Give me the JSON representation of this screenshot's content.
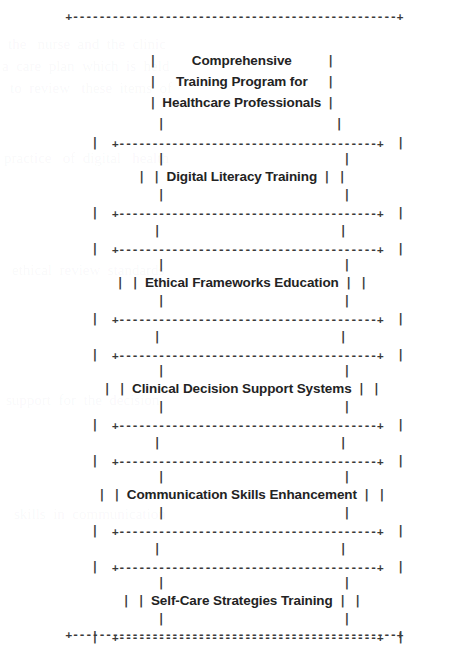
{
  "document": {
    "kind": "ascii-box-diagram",
    "background_color": "#ffffff",
    "ink_color": "#2b2b2b",
    "rule_color": "#3a3a3a"
  },
  "glyphs": {
    "corner": "+",
    "vertical": "|",
    "horizontal_dash": "-",
    "outer_rule": "+-------------------------------------------------+",
    "inner_rule": "+---------------------------------------+"
  },
  "title": {
    "lines": [
      "Comprehensive",
      "Training Program for",
      "Healthcare Professionals"
    ],
    "full_text": "Comprehensive Training Program for Healthcare Professionals"
  },
  "modules": [
    {
      "index": 1,
      "label": "Digital Literacy Training"
    },
    {
      "index": 2,
      "label": "Ethical Frameworks Education"
    },
    {
      "index": 3,
      "label": "Clinical Decision Support Systems"
    },
    {
      "index": 4,
      "label": "Communication Skills Enhancement"
    },
    {
      "index": 5,
      "label": "Self-Care Strategies Training"
    }
  ],
  "rows": {
    "r_outer_top": "+-------------------------------------------------+",
    "r_title_1": "Comprehensive",
    "r_title_2": "Training Program for",
    "r_title_3": "Healthcare Professionals",
    "r_box1_top": "+---------------------------------------+",
    "r_box1_label": "Digital Literacy Training",
    "r_box1_bottom": "+---------------------------------------+",
    "r_box2_top": "+---------------------------------------+",
    "r_box2_label": "Ethical Frameworks Education",
    "r_box2_bottom": "+---------------------------------------+",
    "r_box3_top": "+---------------------------------------+",
    "r_box3_label": "Clinical Decision Support Systems",
    "r_box3_bottom": "+---------------------------------------+",
    "r_box4_top": "+---------------------------------------+",
    "r_box4_label": "Communication Skills Enhancement",
    "r_box4_bottom": "+---------------------------------------+",
    "r_box5_top": "+---------------------------------------+",
    "r_box5_label": "Self-Care Strategies Training",
    "r_box5_bottom": "+---------------------------------------+",
    "r_outer_bottom": "+-------------------------------------------------+",
    "pipe_single": "|",
    "pipe_double": "|   |"
  }
}
